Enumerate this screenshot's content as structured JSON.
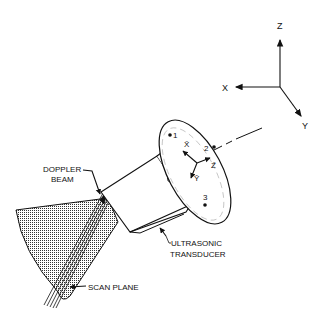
{
  "diagram": {
    "type": "technical-illustration",
    "axes": {
      "global": {
        "x_label": "X",
        "y_label": "Y",
        "z_label": "Z"
      },
      "local": {
        "x_label": "X̄",
        "y_label": "Ȳ",
        "z_label": "Z̄"
      }
    },
    "markers": [
      {
        "id": "1",
        "label": "1"
      },
      {
        "id": "2",
        "label": "2"
      },
      {
        "id": "3",
        "label": "3"
      }
    ],
    "callouts": {
      "doppler_beam_line1": "DOPPLER",
      "doppler_beam_line2": "BEAM",
      "ultrasonic_transducer_line1": "ULTRASONIC",
      "ultrasonic_transducer_line2": "TRANSDUCER",
      "scan_plane": "SCAN PLANE"
    },
    "colors": {
      "ink": "#111111",
      "background": "#ffffff",
      "shading": "#555555"
    }
  }
}
